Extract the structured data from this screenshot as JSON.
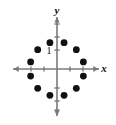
{
  "figure": {
    "title": "",
    "background_color": "#ffffff",
    "width": 116,
    "height": 125
  },
  "axes": {
    "x_axis_label": "x",
    "y_axis_label": "y",
    "axis_color": "#7a7a7a",
    "origin": {
      "x": 57,
      "y": 69
    },
    "unit_px": 13,
    "x_ticks": [
      -3,
      -2,
      -1,
      1,
      2,
      3
    ],
    "y_ticks": [
      -3,
      -2,
      -1,
      1,
      2,
      3
    ],
    "tick_label_text": "1",
    "tick_label_value": 1,
    "x_arrow_both_ends": true,
    "y_arrow_both_ends": true
  },
  "chart_data": {
    "type": "scatter",
    "title": "",
    "xlabel": "x",
    "ylabel": "y",
    "grid": false,
    "legend": null,
    "xlim": [
      -3.6,
      3.6
    ],
    "ylim": [
      -4.2,
      4.2
    ],
    "marker": "filled-circle",
    "marker_color": "#111111",
    "marker_radius_px": 3.4,
    "point_count": 12,
    "circle_radius_units": 2.1,
    "angles_deg": [
      15,
      45,
      75,
      105,
      135,
      165,
      195,
      225,
      255,
      285,
      315,
      345
    ],
    "x": [
      2.028,
      1.485,
      0.544,
      -0.544,
      -1.485,
      -2.028,
      -2.028,
      -1.485,
      -0.544,
      0.544,
      1.485,
      2.028
    ],
    "y": [
      0.544,
      1.485,
      2.028,
      2.028,
      1.485,
      0.544,
      -0.544,
      -1.485,
      -2.028,
      -2.028,
      -1.485,
      -0.544
    ],
    "points": [
      {
        "x": 2.028,
        "y": 0.544
      },
      {
        "x": 1.485,
        "y": 1.485
      },
      {
        "x": 0.544,
        "y": 2.028
      },
      {
        "x": -0.544,
        "y": 2.028
      },
      {
        "x": -1.485,
        "y": 1.485
      },
      {
        "x": -2.028,
        "y": 0.544
      },
      {
        "x": -2.028,
        "y": -0.544
      },
      {
        "x": -1.485,
        "y": -1.485
      },
      {
        "x": -0.544,
        "y": -2.028
      },
      {
        "x": 0.544,
        "y": -2.028
      },
      {
        "x": 1.485,
        "y": -1.485
      },
      {
        "x": 2.028,
        "y": -0.544
      }
    ]
  }
}
